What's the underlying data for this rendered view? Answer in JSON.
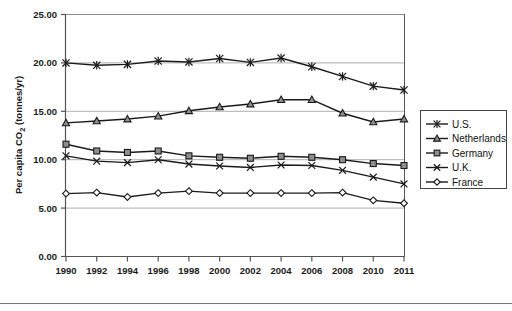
{
  "chart_data": {
    "type": "line",
    "title": "",
    "xlabel": "",
    "ylabel": "Per capita CO2 (tonnes/yr)",
    "ylabel_parts": {
      "prefix": "Per capita CO",
      "sub": "2",
      "suffix": " (tonnes/yr)"
    },
    "x": [
      1990,
      1992,
      1994,
      1996,
      1998,
      2000,
      2002,
      2004,
      2006,
      2008,
      2010,
      2011
    ],
    "categories": [
      "1990",
      "1992",
      "1994",
      "1996",
      "1998",
      "2000",
      "2002",
      "2004",
      "2006",
      "2008",
      "2010",
      "2011"
    ],
    "ylim": [
      0,
      25
    ],
    "yticks": [
      0,
      5,
      10,
      15,
      20,
      25
    ],
    "ytick_labels": [
      "0.00",
      "5.00",
      "10.00",
      "15.00",
      "20.00",
      "25.00"
    ],
    "grid": true,
    "legend_position": "right",
    "series": [
      {
        "name": "U.S.",
        "marker": "asterisk",
        "values": [
          20.0,
          19.75,
          19.85,
          20.2,
          20.1,
          20.45,
          20.05,
          20.5,
          19.6,
          18.6,
          17.6,
          17.2
        ]
      },
      {
        "name": "Netherlands",
        "marker": "triangle",
        "values": [
          13.8,
          14.0,
          14.2,
          14.5,
          15.05,
          15.45,
          15.75,
          16.2,
          16.2,
          14.8,
          13.9,
          14.2
        ]
      },
      {
        "name": "Germany",
        "marker": "square",
        "values": [
          11.6,
          10.9,
          10.75,
          10.9,
          10.4,
          10.25,
          10.15,
          10.35,
          10.25,
          10.0,
          9.6,
          9.4
        ]
      },
      {
        "name": "U.K.",
        "marker": "x",
        "values": [
          10.4,
          9.85,
          9.7,
          10.0,
          9.55,
          9.35,
          9.2,
          9.45,
          9.4,
          8.9,
          8.2,
          7.5
        ]
      },
      {
        "name": "France",
        "marker": "diamond",
        "values": [
          6.5,
          6.6,
          6.15,
          6.55,
          6.75,
          6.55,
          6.55,
          6.55,
          6.55,
          6.6,
          5.8,
          5.5
        ]
      }
    ],
    "colors": {
      "line": "#1a1a1a",
      "grid": "#9a9a9a",
      "frame": "#555555",
      "marker_fill": "#8e8e8e",
      "background": "#ffffff"
    }
  },
  "legend": {
    "items": [
      {
        "label": "U.S.",
        "marker": "asterisk"
      },
      {
        "label": "Netherlands",
        "marker": "triangle"
      },
      {
        "label": "Germany",
        "marker": "square"
      },
      {
        "label": "U.K.",
        "marker": "x"
      },
      {
        "label": "France",
        "marker": "diamond"
      }
    ]
  }
}
